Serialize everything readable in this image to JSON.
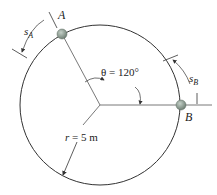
{
  "diagram": {
    "point_a_label": "A",
    "point_b_label": "B",
    "arc_a_label": "s",
    "arc_a_sub": "A",
    "arc_b_label": "s",
    "arc_b_sub": "B",
    "angle_label": "θ = 120°",
    "radius_label_var": "r",
    "radius_label_val": " = 5 m",
    "colors": {
      "line": "#333333",
      "particle": "#8a9a8f",
      "background": "#ffffff"
    }
  }
}
